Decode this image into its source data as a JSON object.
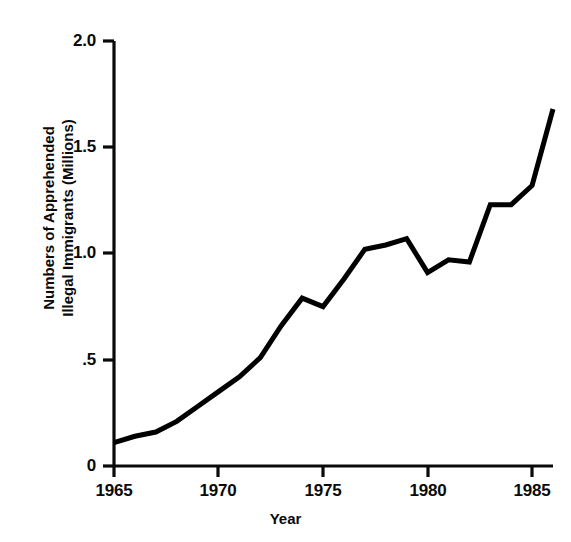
{
  "chart_data": {
    "type": "line",
    "title": "",
    "subtitle": "",
    "xlabel": "Year",
    "ylabel": "Numbers of Apprehended Illegal Immigrants (Millions)",
    "ylabel_lines": [
      "Numbers of Apprehended",
      "Illegal Immigrants (Millions)"
    ],
    "xlim": [
      1965,
      1986
    ],
    "ylim": [
      0,
      2.0
    ],
    "grid": false,
    "legend": null,
    "legend_position": "none",
    "line_color": "#000000",
    "line_width_px": 5,
    "background_color": "#ffffff",
    "xtick_labels": [
      "1965",
      "1970",
      "1975",
      "1980",
      "1985"
    ],
    "xtick_values": [
      1965,
      1970,
      1975,
      1980,
      1985
    ],
    "ytick_labels": [
      "0",
      ".5",
      "1.0",
      "1.5",
      "2.0"
    ],
    "ytick_values": [
      0,
      0.5,
      1.0,
      1.5,
      2.0
    ],
    "x": [
      1965,
      1966,
      1967,
      1968,
      1969,
      1970,
      1971,
      1972,
      1973,
      1974,
      1975,
      1976,
      1977,
      1978,
      1979,
      1980,
      1981,
      1982,
      1983,
      1984,
      1985,
      1986
    ],
    "values": [
      0.11,
      0.14,
      0.16,
      0.21,
      0.28,
      0.35,
      0.42,
      0.51,
      0.66,
      0.79,
      0.75,
      0.88,
      1.02,
      1.04,
      1.07,
      0.91,
      0.97,
      0.96,
      1.23,
      1.23,
      1.32,
      1.68
    ],
    "series": [
      {
        "name": "Apprehended Illegal Immigrants",
        "values": [
          0.11,
          0.14,
          0.16,
          0.21,
          0.28,
          0.35,
          0.42,
          0.51,
          0.66,
          0.79,
          0.75,
          0.88,
          1.02,
          1.04,
          1.07,
          0.91,
          0.97,
          0.96,
          1.23,
          1.23,
          1.32,
          1.68
        ]
      }
    ],
    "annotations": []
  },
  "axes": {
    "y_axis_name": "y-axis",
    "x_axis_name": "x-axis"
  }
}
